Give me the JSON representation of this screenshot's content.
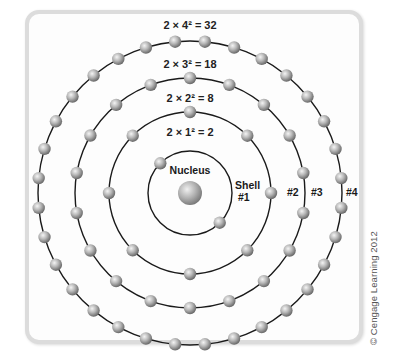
{
  "diagram": {
    "center": {
      "x": 190,
      "y": 193
    },
    "nucleus": {
      "label": "Nucleus",
      "radius": 12
    },
    "shells": [
      {
        "number": 1,
        "radius": 42,
        "electrons": 2,
        "offset_deg": -45,
        "formula": "2 × 1² = 2",
        "label_line1": "Shell",
        "label_line2": "#1"
      },
      {
        "number": 2,
        "radius": 81,
        "electrons": 8,
        "offset_deg": 0,
        "formula": "2 × 2² = 8",
        "label": "#2"
      },
      {
        "number": 3,
        "radius": 115,
        "electrons": 18,
        "offset_deg": 10,
        "formula": "2 × 3² = 18",
        "label": "#3"
      },
      {
        "number": 4,
        "radius": 152,
        "electrons": 32,
        "offset_deg": 5.625,
        "formula": "2 × 4² = 32",
        "label": "#4"
      }
    ],
    "colors": {
      "orbit": "#1a1a1a",
      "electron_light": "#f2f2f2",
      "electron_dark": "#6a6a6a",
      "panel_border": "#dcdcdc"
    }
  },
  "copyright": "© Cengage Learning 2012"
}
